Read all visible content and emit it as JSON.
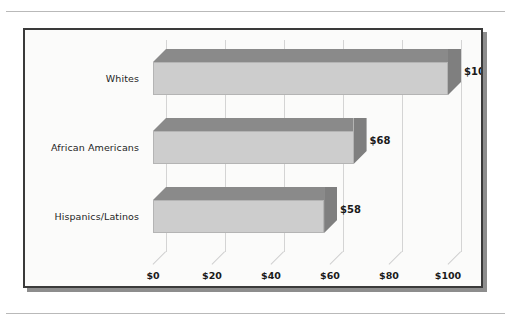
{
  "figure": {
    "frame_label": "chart-frame",
    "background_color": "#fbfbfa",
    "border_color": "#3a3a3a",
    "bar_front_color": "#cdcdcd",
    "bar_top_color": "#8a8a8a",
    "bar_cap_color": "#7f7f7f",
    "gridline_color": "#d4d4d4",
    "text_color": "#1a1a1a"
  },
  "chart_data": {
    "type": "bar",
    "orientation": "horizontal",
    "title": "",
    "subtitle": "",
    "xlabel": "",
    "ylabel": "",
    "categories": [
      "Whites",
      "African Americans",
      "Hispanics/Latinos"
    ],
    "values": [
      100,
      68,
      58
    ],
    "value_labels": [
      "$100",
      "$68",
      "$58"
    ],
    "xlim": [
      0,
      100
    ],
    "xticks": [
      0,
      20,
      40,
      60,
      80,
      100
    ],
    "xtick_labels": [
      "$0",
      "$20",
      "$40",
      "$60",
      "$80",
      "$100"
    ],
    "grid": true,
    "legend": false,
    "legend_position": "none",
    "style": "3d-horizontal-bar",
    "series": [
      {
        "name": "Median wealth",
        "values": [
          100,
          68,
          58
        ]
      }
    ]
  }
}
